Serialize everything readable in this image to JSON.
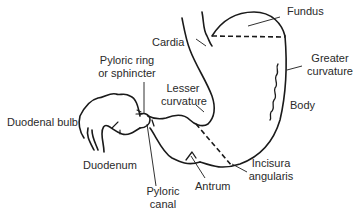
{
  "diagram": {
    "line_color": "#1a1a1a",
    "labels": {
      "fundus": "Fundus",
      "cardia": "Cardia",
      "pyloric_ring_1": "Pyloric ring",
      "pyloric_ring_2": "or sphincter",
      "greater_curvature_1": "Greater",
      "greater_curvature_2": "curvature",
      "lesser_curvature_1": "Lesser",
      "lesser_curvature_2": "curvature",
      "body": "Body",
      "duodenal_bulb": "Duodenal bulb",
      "duodenum": "Duodenum",
      "incisura_angularis_1": "Incisura",
      "incisura_angularis_2": "angularis",
      "pyloric_canal_1": "Pyloric",
      "pyloric_canal_2": "canal",
      "antrum": "Antrum"
    }
  }
}
